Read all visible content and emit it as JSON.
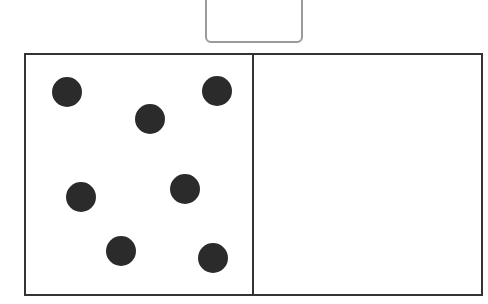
{
  "diagram": {
    "top_box": {
      "label": ""
    },
    "frame": {
      "panels": [
        {
          "name": "left",
          "dot_count": 7
        },
        {
          "name": "right",
          "dot_count": 0
        }
      ]
    },
    "dots": [
      {
        "x": 67,
        "y": 92
      },
      {
        "x": 150,
        "y": 119
      },
      {
        "x": 217,
        "y": 91
      },
      {
        "x": 81,
        "y": 197
      },
      {
        "x": 185,
        "y": 189
      },
      {
        "x": 121,
        "y": 251
      },
      {
        "x": 213,
        "y": 258
      }
    ],
    "colors": {
      "dot": "#2b2b2b",
      "frame": "#333333",
      "top_box_border": "#9a9a9a"
    }
  }
}
